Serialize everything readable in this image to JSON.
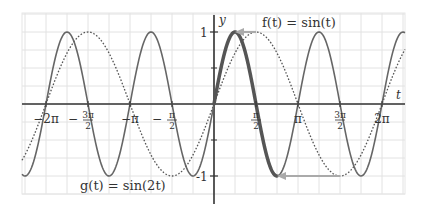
{
  "chart_data": {
    "type": "line",
    "title": "",
    "xlabel": "t",
    "ylabel": "y",
    "xlim_pi": [
      -2.29,
      2.27
    ],
    "ylim": [
      -1.25,
      1.25
    ],
    "grid": true,
    "x_ticks": [
      {
        "value_pi": -2,
        "label": "−2π"
      },
      {
        "value_pi": -1.5,
        "label_num": "3π",
        "label_den": "2",
        "negative": true
      },
      {
        "value_pi": -1,
        "label": "−π"
      },
      {
        "value_pi": -0.5,
        "label_num": "π",
        "label_den": "2",
        "negative": true
      },
      {
        "value_pi": 0.5,
        "label_num": "π",
        "label_den": "2",
        "negative": false
      },
      {
        "value_pi": 1,
        "label": "π"
      },
      {
        "value_pi": 1.5,
        "label_num": "3π",
        "label_den": "2",
        "negative": false
      },
      {
        "value_pi": 2,
        "label": "2π"
      }
    ],
    "y_ticks": [
      {
        "value": 1,
        "label": "1"
      },
      {
        "value": -1,
        "label": "-1"
      }
    ],
    "series": [
      {
        "name": "f(t) = sin(t)",
        "function": "sin(t)",
        "style": "dotted",
        "color": "#555555"
      },
      {
        "name": "g(t) = sin(2t)",
        "function": "sin(2t)",
        "style": "solid",
        "color": "#666666",
        "highlight": {
          "t_range_pi": [
            0,
            0.75
          ],
          "color": "#555555",
          "width": 3.5
        }
      }
    ],
    "annotations": [
      {
        "type": "arrow",
        "from": {
          "t_pi": 0.5,
          "y": 1
        },
        "to": {
          "t_pi": 0.25,
          "y": 1
        },
        "color": "#aaaaaa"
      },
      {
        "type": "arrow",
        "from": {
          "t_pi": 1.5,
          "y": -1
        },
        "to": {
          "t_pi": 0.75,
          "y": -1
        },
        "color": "#aaaaaa"
      },
      {
        "type": "label",
        "text": "f(t) = sin(t)",
        "position": "top-right"
      },
      {
        "type": "label",
        "text": "g(t) = sin(2t)",
        "position": "bottom-left"
      }
    ]
  },
  "labels": {
    "f_label": "f(t) = sin(t)",
    "g_label": "g(t) = sin(2t)",
    "x_axis": "t",
    "y_axis": "y",
    "y_one": "1",
    "y_neg_one": "-1"
  }
}
